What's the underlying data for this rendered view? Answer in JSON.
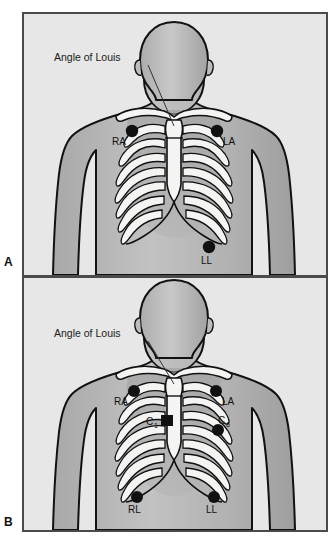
{
  "figure": {
    "type": "medical-illustration",
    "background_color": "#ffffff",
    "panel_background": "#e6e7e6",
    "panel_border_color": "#4a4a4a",
    "skin_color": "#b9b9b9",
    "bone_color": "#f2f2f0",
    "electrode_color": "#111111",
    "outline_color": "#111111"
  },
  "panels": [
    {
      "id": "A",
      "letter": "A",
      "caption_position": "bottom-left-outside",
      "annotation": {
        "label": "Angle of Louis",
        "leader_line": true
      },
      "electrodes": [
        {
          "code": "RA",
          "label": "RA",
          "subscript": "",
          "region": "right shoulder / infraclavicular",
          "side": "patient-right"
        },
        {
          "code": "LA",
          "label": "LA",
          "subscript": "",
          "region": "left shoulder / infraclavicular",
          "side": "patient-left"
        },
        {
          "code": "LL",
          "label": "LL",
          "subscript": "",
          "region": "left lower abdomen / flank",
          "side": "patient-left"
        }
      ]
    },
    {
      "id": "B",
      "letter": "B",
      "caption_position": "bottom-left-outside",
      "annotation": {
        "label": "Angle of Louis",
        "leader_line": true
      },
      "electrodes": [
        {
          "code": "RA",
          "label": "RA",
          "subscript": "",
          "region": "right shoulder / infraclavicular",
          "side": "patient-right"
        },
        {
          "code": "LA",
          "label": "LA",
          "subscript": "",
          "region": "left shoulder / infraclavicular",
          "side": "patient-left"
        },
        {
          "code": "C1",
          "label": "C",
          "subscript": "1",
          "region": "4th intercostal space, right sternal border",
          "side": "patient-right"
        },
        {
          "code": "C6",
          "label": "C",
          "subscript": "6",
          "region": "5th intercostal space, left midaxillary line",
          "side": "patient-left"
        },
        {
          "code": "RL",
          "label": "RL",
          "subscript": "",
          "region": "right lower abdomen / flank",
          "side": "patient-right"
        },
        {
          "code": "LL",
          "label": "LL",
          "subscript": "",
          "region": "left lower abdomen / flank",
          "side": "patient-left"
        }
      ]
    }
  ]
}
